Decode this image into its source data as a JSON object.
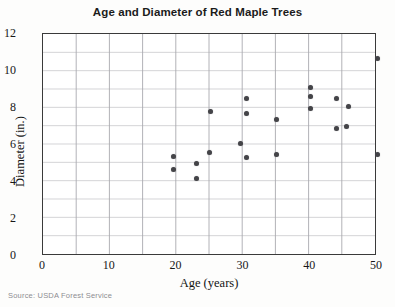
{
  "chart_data": {
    "type": "scatter",
    "title": "Age and Diameter of Red Maple Trees",
    "xlabel": "Age (years)",
    "ylabel": "Diameter (in.)",
    "xlim": [
      0,
      50
    ],
    "ylim": [
      0,
      12
    ],
    "xticks": [
      0,
      10,
      20,
      30,
      40,
      50
    ],
    "yticks": [
      0,
      2,
      4,
      6,
      8,
      10,
      12
    ],
    "x_gridlines": [
      0,
      5,
      10,
      15,
      20,
      25,
      30,
      35,
      40,
      45,
      50
    ],
    "y_gridlines": [
      0,
      1,
      2,
      3,
      4,
      5,
      6,
      7,
      8,
      9,
      10,
      11,
      12
    ],
    "grid": true,
    "legend": false,
    "marker_color": "#444448",
    "x": [
      19.6,
      19.6,
      23.0,
      23.0,
      24.9,
      25.0,
      29.6,
      30.5,
      30.5,
      30.5,
      35.0,
      35.0,
      40.0,
      40.0,
      40.0,
      44.0,
      44.0,
      45.4,
      45.8,
      50.0,
      50.0
    ],
    "y": [
      5.4,
      4.7,
      5.0,
      4.2,
      5.6,
      7.8,
      6.1,
      8.5,
      7.7,
      5.3,
      7.4,
      5.5,
      9.1,
      8.6,
      8.0,
      8.5,
      6.9,
      7.0,
      8.1,
      10.7,
      5.5
    ],
    "points": [
      {
        "age": 19.6,
        "diameter": 5.4
      },
      {
        "age": 19.6,
        "diameter": 4.7
      },
      {
        "age": 23.0,
        "diameter": 5.0
      },
      {
        "age": 23.0,
        "diameter": 4.2
      },
      {
        "age": 24.9,
        "diameter": 5.6
      },
      {
        "age": 25.0,
        "diameter": 7.8
      },
      {
        "age": 29.6,
        "diameter": 6.1
      },
      {
        "age": 30.5,
        "diameter": 8.5
      },
      {
        "age": 30.5,
        "diameter": 7.7
      },
      {
        "age": 30.5,
        "diameter": 5.3
      },
      {
        "age": 35.0,
        "diameter": 7.4
      },
      {
        "age": 35.0,
        "diameter": 5.5
      },
      {
        "age": 40.0,
        "diameter": 9.1
      },
      {
        "age": 40.0,
        "diameter": 8.6
      },
      {
        "age": 40.0,
        "diameter": 8.0
      },
      {
        "age": 44.0,
        "diameter": 8.5
      },
      {
        "age": 44.0,
        "diameter": 6.9
      },
      {
        "age": 45.4,
        "diameter": 7.0
      },
      {
        "age": 45.8,
        "diameter": 8.1
      },
      {
        "age": 50.0,
        "diameter": 10.7
      },
      {
        "age": 50.0,
        "diameter": 5.5
      }
    ]
  },
  "source": {
    "note": "Source: USDA Forest Service"
  }
}
